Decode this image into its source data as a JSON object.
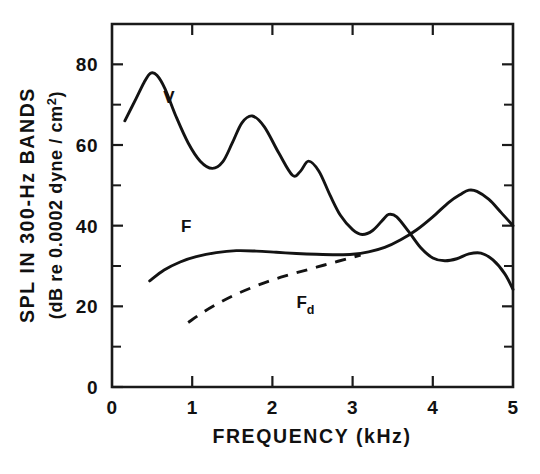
{
  "chart_data": {
    "type": "line",
    "title": "",
    "xlabel": "FREQUENCY (kHz)",
    "ylabel_line1": "SPL IN 300-Hz BANDS",
    "ylabel_line2_pre": "(dB re 0.0002 dyne / cm",
    "ylabel_line2_sup": "2",
    "ylabel_line2_post": ")",
    "xlim": [
      0,
      5
    ],
    "ylim": [
      0,
      90
    ],
    "x_ticks": [
      "0",
      "1",
      "2",
      "3",
      "4",
      "5"
    ],
    "x_tick_values": [
      0,
      1,
      2,
      3,
      4,
      5
    ],
    "y_ticks": [
      "0",
      "20",
      "40",
      "60",
      "80"
    ],
    "y_tick_values": [
      0,
      20,
      40,
      60,
      80
    ],
    "y_minor_values": [
      10,
      30,
      50,
      70
    ],
    "grid": false,
    "legend_position": "inline-annotations",
    "series": [
      {
        "name": "V",
        "label": "V",
        "style": "solid",
        "label_x": 0.64,
        "label_y": 70.5,
        "x": [
          0.16,
          0.3,
          0.4,
          0.48,
          0.56,
          0.66,
          0.8,
          0.95,
          1.1,
          1.25,
          1.38,
          1.5,
          1.62,
          1.75,
          1.9,
          2.08,
          2.25,
          2.35,
          2.45,
          2.58,
          2.72,
          2.85,
          3.0,
          3.12,
          3.25,
          3.38,
          3.45,
          3.55,
          3.7,
          3.85,
          4.0,
          4.15,
          4.3,
          4.45,
          4.6,
          4.75,
          4.9,
          5.0
        ],
        "y": [
          66.0,
          71.5,
          75.5,
          77.8,
          77.3,
          74.0,
          67.0,
          60.5,
          56.0,
          54.2,
          55.8,
          60.5,
          65.5,
          67.2,
          64.5,
          58.0,
          52.5,
          53.5,
          56.0,
          53.5,
          47.5,
          42.5,
          39.0,
          37.8,
          38.8,
          41.5,
          42.8,
          42.2,
          38.5,
          34.5,
          32.0,
          31.3,
          31.8,
          33.0,
          33.2,
          31.5,
          28.0,
          24.2
        ]
      },
      {
        "name": "F",
        "label": "F",
        "style": "solid",
        "label_x": 0.86,
        "label_y": 38.5,
        "x": [
          0.47,
          0.65,
          0.85,
          1.05,
          1.3,
          1.55,
          1.8,
          2.05,
          2.3,
          2.55,
          2.8,
          3.0,
          3.2,
          3.4,
          3.6,
          3.8,
          4.0,
          4.2,
          4.35,
          4.45,
          4.55,
          4.7,
          4.85,
          5.0
        ],
        "y": [
          26.3,
          29.0,
          31.0,
          32.3,
          33.3,
          33.8,
          33.7,
          33.4,
          33.1,
          32.9,
          32.8,
          32.9,
          33.5,
          34.6,
          36.5,
          39.0,
          42.2,
          45.8,
          47.8,
          48.8,
          48.5,
          46.5,
          43.3,
          40.0
        ]
      },
      {
        "name": "Fd",
        "label": "F",
        "label_sub": "d",
        "style": "dashed",
        "label_x": 2.3,
        "label_y": 19.5,
        "x": [
          0.95,
          1.15,
          1.35,
          1.55,
          1.75,
          1.95,
          2.15,
          2.35,
          2.55,
          2.75,
          2.95,
          3.1
        ],
        "y": [
          16.0,
          18.7,
          21.0,
          23.0,
          24.7,
          26.2,
          27.5,
          28.6,
          29.7,
          30.8,
          31.9,
          32.7
        ]
      }
    ]
  },
  "colors": {
    "ink": "#131313",
    "background": "#ffffff"
  }
}
